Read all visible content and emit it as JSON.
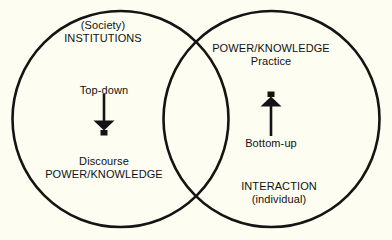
{
  "diagram": {
    "background_color": "#fdfdf1",
    "stroke_color": "#141414",
    "text_color": "#111111",
    "left_circle": {
      "name": "institutions-circle",
      "top_label_line1": "(Society)",
      "top_label_line2": "INSTITUTIONS",
      "bottom_label_line1": "Discourse",
      "bottom_label_line2": "POWER/KNOWLEDGE",
      "arrow_caption": "Top-down",
      "arrow_direction": "down"
    },
    "right_circle": {
      "name": "interaction-circle",
      "top_label_line1": "POWER/KNOWLEDGE",
      "top_label_line2": "Practice",
      "bottom_label_line1": "INTERACTION",
      "bottom_label_line2": "(individual)",
      "arrow_caption": "Bottom-up",
      "arrow_direction": "up"
    }
  }
}
